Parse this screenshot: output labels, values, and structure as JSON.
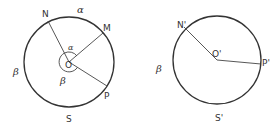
{
  "figure": {
    "left_diagram": {
      "center_label": "O",
      "points": {
        "N": "N",
        "M": "M",
        "P": "P",
        "S": "S"
      },
      "arc_labels": {
        "outer_alpha": "α",
        "outer_beta": "β",
        "inner_alpha": "α",
        "inner_beta": "β"
      }
    },
    "right_diagram": {
      "center_label": "O'",
      "points": {
        "N": "N'",
        "P": "P'",
        "S": "S'"
      },
      "arc_labels": {
        "outer_beta": "β"
      }
    },
    "colors": {
      "stroke": "#333333",
      "background": "#ffffff"
    }
  }
}
